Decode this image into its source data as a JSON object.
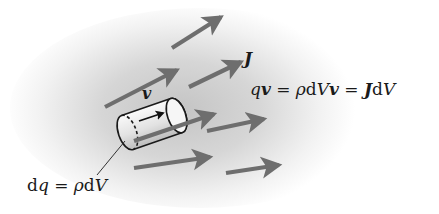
{
  "diagram": {
    "type": "physics-current-density",
    "colors": {
      "arrow": "#6e6e6e",
      "outline": "#1a1a1a",
      "shading_center": "#c8c8c8",
      "background": "#ffffff"
    },
    "labels": {
      "J": {
        "sym": "J"
      },
      "v": {
        "sym": "v"
      },
      "eq": {
        "q": "q",
        "v1": "v",
        "eq1": " = ",
        "rho": "ρ",
        "d": "d",
        "V": "V",
        "v2": "v",
        "eq2": " = ",
        "J": "J",
        "d2": "d",
        "V2": "V"
      },
      "dq": {
        "d": "d",
        "q": "q",
        "eq": " = ",
        "rho": "ρ",
        "d2": "d",
        "V": "V"
      }
    },
    "arrows": [
      {
        "x1": 172,
        "y1": 48,
        "x2": 221,
        "y2": 17
      },
      {
        "x1": 105,
        "y1": 107,
        "x2": 177,
        "y2": 70
      },
      {
        "x1": 189,
        "y1": 87,
        "x2": 241,
        "y2": 62
      },
      {
        "x1": 134,
        "y1": 141,
        "x2": 214,
        "y2": 114
      },
      {
        "x1": 207,
        "y1": 131,
        "x2": 264,
        "y2": 119
      },
      {
        "x1": 134,
        "y1": 168,
        "x2": 210,
        "y2": 157
      },
      {
        "x1": 226,
        "y1": 173,
        "x2": 279,
        "y2": 165
      }
    ]
  }
}
